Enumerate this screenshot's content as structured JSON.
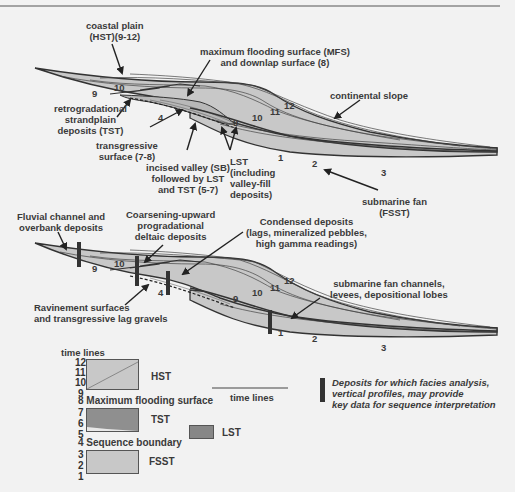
{
  "colors": {
    "background": "#f2f2f2",
    "fill_light": "#c8c8c8",
    "fill_tst": "#8f8f8f",
    "fill_lst": "#878787",
    "line_dark": "#333333",
    "text": "#3a3a3a"
  },
  "top_diagram": {
    "labels": {
      "coastal_plain": "coastal plain\n(HST)(9-12)",
      "mfs": "maximum flooding surface (MFS)\nand downlap surface (8)",
      "continental_slope": "continental slope",
      "retrogradational": "retrogradational\nstrandplain\ndeposits (TST)",
      "transgressive_surface": "transgressive\nsurface (7-8)",
      "incised_valley": "incised valley (SB)\nfollowed by LST\nand TST (5-7)",
      "lst": "LST\n(including\nvalley-fill\ndeposits)",
      "submarine_fan": "submarine fan\n(FSST)"
    },
    "time_line_numbers": [
      "9",
      "10",
      "4",
      "9",
      "10",
      "11",
      "12",
      "1",
      "2",
      "3"
    ]
  },
  "bottom_diagram": {
    "labels": {
      "fluvial": "Fluvial channel and\noverbank deposits",
      "coarsening": "Coarsening-upward\nprogradational\ndeltaic deposits",
      "condensed": "Condensed deposits\n(lags, mineralized pebbles,\nhigh gamma readings)",
      "ravinement": "Ravinement surfaces\nand transgressive lag gravels",
      "fan_channels": "submarine fan channels,\nlevees, depositional lobes"
    },
    "time_line_numbers": [
      "9",
      "10",
      "4",
      "9",
      "10",
      "11",
      "12",
      "1",
      "2",
      "3"
    ]
  },
  "legend": {
    "title": "time lines",
    "numbers": [
      "12",
      "11",
      "10",
      "9",
      "7",
      "6",
      "5",
      "3",
      "2",
      "1"
    ],
    "surfaces": {
      "mfs": "8 Maximum flooding surface",
      "sb": "4 Sequence boundary"
    },
    "tracts": {
      "hst": "HST",
      "tst": "TST",
      "fsst": "FSST",
      "lst": "LST"
    },
    "time_lines_key": "time lines",
    "bar_key": "Deposits for which facies analysis,\nvertical profiles, may provide\nkey data for sequence interpretation"
  }
}
